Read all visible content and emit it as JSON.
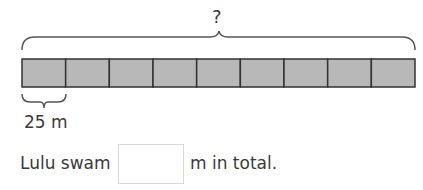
{
  "diagram": {
    "total_label": "?",
    "segment_count": 9,
    "segment_label": "25 m",
    "segment_fill": "#b8b8b8",
    "segment_stroke": "#333333"
  },
  "sentence": {
    "prefix": "Lulu swam",
    "suffix": "m in total.",
    "answer_value": ""
  }
}
